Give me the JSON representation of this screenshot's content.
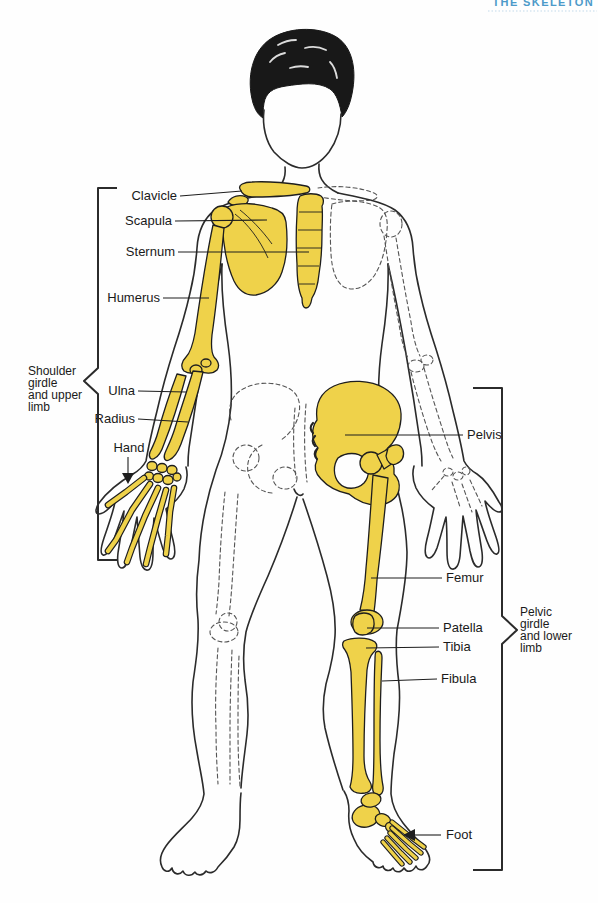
{
  "page": {
    "header": "THE SKELETON",
    "header_color": "#4D9AC9",
    "bone_highlight_color": "#EFD24A",
    "outline_color": "#2B2B2B",
    "label_color": "#1A1A1A"
  },
  "labels": {
    "clavicle": "Clavicle",
    "scapula": "Scapula",
    "sternum": "Sternum",
    "humerus": "Humerus",
    "ulna": "Ulna",
    "radius": "Radius",
    "hand": "Hand",
    "pelvis": "Pelvis",
    "femur": "Femur",
    "patella": "Patella",
    "tibia": "Tibia",
    "fibula": "Fibula",
    "foot": "Foot"
  },
  "brackets": {
    "left": {
      "lines": [
        "Shoulder",
        "girdle",
        "and upper",
        "limb"
      ]
    },
    "right": {
      "lines": [
        "Pelvic",
        "girdle",
        "and lower",
        "limb"
      ]
    }
  }
}
